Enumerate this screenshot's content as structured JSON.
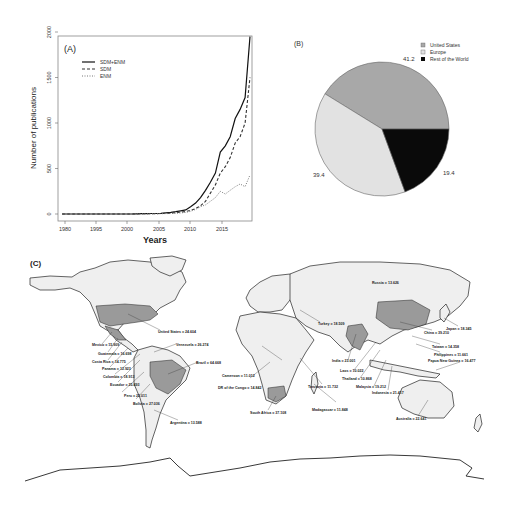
{
  "chart_data": [
    {
      "panel": "A",
      "type": "line",
      "title": "(A)",
      "xlabel": "Years",
      "ylabel": "Number of publications",
      "xlim": [
        1980,
        2018
      ],
      "ylim": [
        0,
        2000
      ],
      "xticks": [
        1980,
        1995,
        2000,
        2005,
        2010,
        2015
      ],
      "xtick_labels": [
        "1980",
        "1995",
        "2000",
        "2005",
        "2010",
        "2015"
      ],
      "yticks": [
        0,
        500,
        1000,
        1500,
        2000
      ],
      "ytick_labels": [
        "0",
        "500",
        "1000",
        "1500",
        "2000"
      ],
      "grid": false,
      "legend_position": "upper-left",
      "x": [
        1980,
        1981,
        1982,
        1983,
        1984,
        1985,
        1986,
        1987,
        1988,
        1989,
        1990,
        1991,
        1992,
        1993,
        1994,
        1995,
        1996,
        1997,
        1998,
        1999,
        2000,
        2001,
        2002,
        2003,
        2004,
        2005,
        2006,
        2007,
        2008,
        2009,
        2010,
        2011,
        2012,
        2013,
        2014,
        2015,
        2016,
        2017,
        2018
      ],
      "series": [
        {
          "name": "SDM+ENM",
          "style": "solid",
          "values": [
            0,
            0,
            0,
            0,
            0,
            0,
            0,
            0,
            0,
            0,
            0,
            0,
            0,
            0,
            0,
            2,
            3,
            4,
            5,
            6,
            8,
            12,
            18,
            25,
            35,
            45,
            80,
            120,
            180,
            260,
            350,
            450,
            680,
            750,
            850,
            1050,
            1150,
            1280,
            1950
          ]
        },
        {
          "name": "SDM",
          "style": "dashed",
          "values": [
            0,
            0,
            0,
            0,
            0,
            0,
            0,
            0,
            0,
            0,
            0,
            0,
            0,
            0,
            0,
            1,
            2,
            3,
            3,
            4,
            5,
            8,
            10,
            15,
            20,
            28,
            40,
            60,
            90,
            140,
            230,
            320,
            450,
            520,
            620,
            780,
            850,
            1000,
            1500
          ]
        },
        {
          "name": "ENM",
          "style": "dotted",
          "values": [
            0,
            0,
            0,
            0,
            0,
            0,
            0,
            0,
            0,
            0,
            0,
            0,
            0,
            0,
            0,
            1,
            1,
            1,
            2,
            2,
            3,
            4,
            6,
            8,
            12,
            18,
            30,
            50,
            80,
            100,
            140,
            180,
            250,
            220,
            260,
            300,
            330,
            300,
            430
          ]
        }
      ]
    },
    {
      "panel": "B",
      "type": "pie",
      "title": "(B)",
      "categories": [
        "United States",
        "Europe",
        "Rest of the World"
      ],
      "values": [
        41.2,
        39.4,
        19.4
      ],
      "value_labels": [
        "41.2",
        "39.4",
        "19.4"
      ],
      "colors": [
        "#a8a8a8",
        "#e2e2e2",
        "#0a0a0a"
      ],
      "legend_position": "upper-right"
    },
    {
      "panel": "C",
      "type": "map",
      "title": "(C)",
      "annotations": [
        {
          "country": "United States",
          "value": "24.604"
        },
        {
          "country": "Mexico",
          "value": "15.909"
        },
        {
          "country": "Guatemala",
          "value": "16.698"
        },
        {
          "country": "Costa Rica",
          "value": "14.775"
        },
        {
          "country": "Panama",
          "value": "12.923"
        },
        {
          "country": "Colombia",
          "value": "18.913"
        },
        {
          "country": "Ecuador",
          "value": "25.493"
        },
        {
          "country": "Peru",
          "value": "22.011"
        },
        {
          "country": "Bolivia",
          "value": "27.036"
        },
        {
          "country": "Venezuela",
          "value": "26.274"
        },
        {
          "country": "Brazil",
          "value": "64.668"
        },
        {
          "country": "Argentina",
          "value": "13.588"
        },
        {
          "country": "Cameroon",
          "value": "11.012"
        },
        {
          "country": "DR of the Congo",
          "value": "14.842"
        },
        {
          "country": "South Africa",
          "value": "37.108"
        },
        {
          "country": "Madagascar",
          "value": "11.848"
        },
        {
          "country": "Tanzania",
          "value": "11.732"
        },
        {
          "country": "Turkey",
          "value": "18.509"
        },
        {
          "country": "India",
          "value": "23.001"
        },
        {
          "country": "Laos",
          "value": "10.022"
        },
        {
          "country": "Thailand",
          "value": "10.868"
        },
        {
          "country": "Malaysia",
          "value": "19.212"
        },
        {
          "country": "Indonesia",
          "value": "21.417"
        },
        {
          "country": "China",
          "value": "39.210"
        },
        {
          "country": "Japan",
          "value": "18.345"
        },
        {
          "country": "Taiwan",
          "value": "14.358"
        },
        {
          "country": "Philippines",
          "value": "11.661"
        },
        {
          "country": "Papua New Guinea",
          "value": "16.477"
        },
        {
          "country": "Australia",
          "value": "22.641"
        },
        {
          "country": "Russia",
          "value": "13.626"
        }
      ]
    }
  ],
  "panelA": {
    "label": "(A)",
    "xlabel": "Years",
    "ylabel": "Number of publications",
    "legend": [
      "SDM+ENM",
      "SDM",
      "ENM"
    ],
    "yticks": [
      "0",
      "500",
      "1000",
      "1500",
      "2000"
    ],
    "xticks": [
      "1980",
      "1995",
      "2000",
      "2005",
      "2010",
      "2015"
    ]
  },
  "panelB": {
    "label": "(B)",
    "legend": [
      "United States",
      "Europe",
      "Rest of the World"
    ],
    "values": [
      "41.2",
      "39.4",
      "19.4"
    ]
  },
  "panelC": {
    "label": "(C)",
    "labels": {
      "usa": "United States = 24.604",
      "mexico": "Mexico = 15.909",
      "guatemala": "Guatemala = 16.698",
      "costarica": "Costa Rica = 14.775",
      "panama": "Panama = 12.923",
      "colombia": "Colombia = 18.913",
      "ecuador": "Ecuador = 25.493",
      "peru": "Peru = 22.011",
      "bolivia": "Bolivia = 27.036",
      "venezuela": "Venezuela = 26.274",
      "brazil": "Brazil = 64.668",
      "argentina": "Argentina = 13.588",
      "cameroon": "Cameroon = 11.012",
      "drc": "DR of the Congo = 14.842",
      "southafrica": "South Africa = 37.108",
      "madagascar": "Madagascar = 11.848",
      "tanzania": "Tanzania = 11.732",
      "turkey": "Turkey = 18.509",
      "india": "India = 23.001",
      "laos": "Laos = 10.022",
      "thailand": "Thailand = 10.868",
      "malaysia": "Malaysia = 19.212",
      "indonesia": "Indonesia = 21.417",
      "china": "China = 39.210",
      "japan": "Japan = 18.345",
      "taiwan": "Taiwan = 14.358",
      "philippines": "Philippines = 11.661",
      "png": "Papua New Guinea = 16.477",
      "australia": "Australia = 22.641",
      "russia": "Russia = 13.626"
    }
  }
}
